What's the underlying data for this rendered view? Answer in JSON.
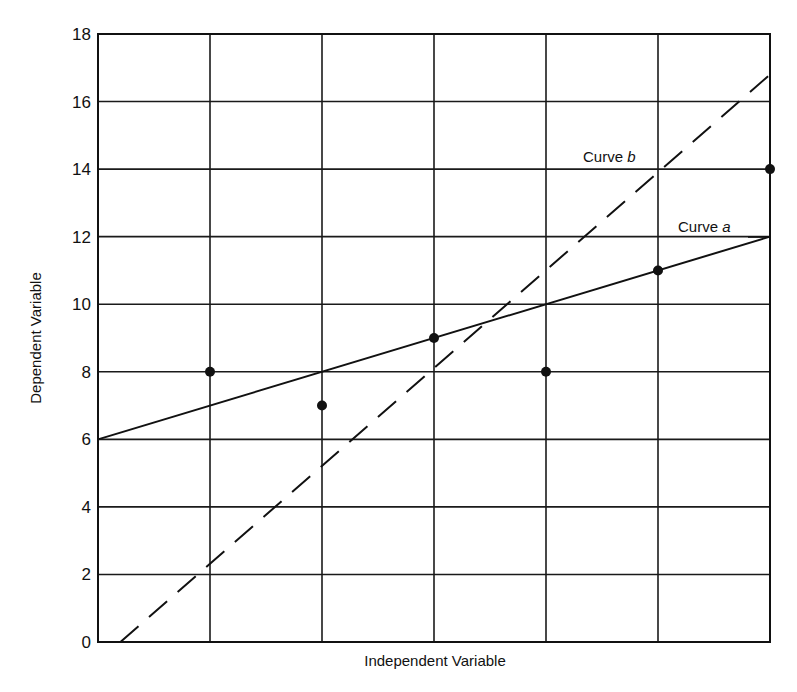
{
  "chart_data": {
    "type": "scatter",
    "title": "",
    "xlabel": "Independent Variable",
    "ylabel": "Dependent Variable",
    "xlim": [
      0,
      6
    ],
    "ylim": [
      0,
      18
    ],
    "x_ticks": [
      0,
      1,
      2,
      3,
      4,
      5,
      6
    ],
    "x_tick_labels_shown": false,
    "y_ticks": [
      0,
      2,
      4,
      6,
      8,
      10,
      12,
      14,
      16,
      18
    ],
    "y_tick_labels": [
      "0",
      "2",
      "4",
      "6",
      "8",
      "10",
      "12",
      "14",
      "16",
      "18"
    ],
    "grid": true,
    "legend": "none (inline curve labels)",
    "points": {
      "name": "Observed data",
      "x": [
        1,
        2,
        3,
        4,
        5,
        6
      ],
      "y": [
        8,
        7,
        9,
        8,
        11,
        14
      ]
    },
    "series": [
      {
        "name": "Curve a",
        "label": "Curve",
        "label_italic": "a",
        "style": "solid",
        "x": [
          0,
          6
        ],
        "y": [
          6,
          12
        ]
      },
      {
        "name": "Curve b",
        "label": "Curve",
        "label_italic": "b",
        "style": "dashed",
        "x": [
          0.2,
          6
        ],
        "y": [
          0,
          16.8
        ]
      }
    ],
    "annotations": [
      {
        "text": "Curve b",
        "x": 4.35,
        "y": 14.4
      },
      {
        "text": "Curve a",
        "x": 5.1,
        "y": 12.2
      }
    ]
  }
}
